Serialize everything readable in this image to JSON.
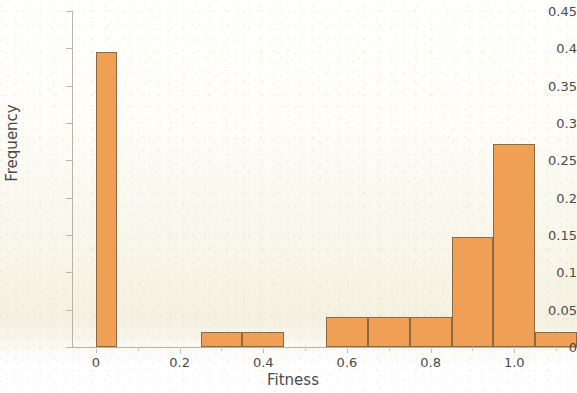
{
  "chart_data": {
    "type": "bar",
    "title": "",
    "subtitle": "",
    "xlabel": "Fitness",
    "ylabel": "Frequency",
    "xlim": [
      -0.055,
      1.15
    ],
    "ylim": [
      0,
      0.45
    ],
    "grid": false,
    "legend": null,
    "bar_color": "#efa055",
    "bar_edge_color": "#8c6a3f",
    "bin_width": 0.1,
    "xticks": [
      "0",
      "0.2",
      "0.4",
      "0.6",
      "0.8",
      "1.0"
    ],
    "xtick_values": [
      0,
      0.2,
      0.4,
      0.6,
      0.8,
      1.0
    ],
    "yticks": [
      "0",
      "0.05",
      "0.1",
      "0.15",
      "0.2",
      "0.25",
      "0.3",
      "0.35",
      "0.4",
      "0.45"
    ],
    "ytick_values": [
      0,
      0.05,
      0.1,
      0.15,
      0.2,
      0.25,
      0.3,
      0.35,
      0.4,
      0.45
    ],
    "bins": [
      {
        "x0": 0.0,
        "x1": 0.05,
        "value": 0.395
      },
      {
        "x0": 0.25,
        "x1": 0.35,
        "value": 0.02
      },
      {
        "x0": 0.35,
        "x1": 0.45,
        "value": 0.02
      },
      {
        "x0": 0.55,
        "x1": 0.65,
        "value": 0.04
      },
      {
        "x0": 0.65,
        "x1": 0.75,
        "value": 0.04
      },
      {
        "x0": 0.75,
        "x1": 0.85,
        "value": 0.04
      },
      {
        "x0": 0.85,
        "x1": 0.95,
        "value": 0.147
      },
      {
        "x0": 0.95,
        "x1": 1.05,
        "value": 0.272
      },
      {
        "x0": 1.05,
        "x1": 1.15,
        "value": 0.02
      }
    ],
    "categories": [
      "0.00-0.05",
      "0.25-0.35",
      "0.35-0.45",
      "0.55-0.65",
      "0.65-0.75",
      "0.75-0.85",
      "0.85-0.95",
      "0.95-1.05",
      "1.05-1.15"
    ],
    "values": [
      0.395,
      0.02,
      0.02,
      0.04,
      0.04,
      0.04,
      0.147,
      0.272,
      0.02
    ]
  }
}
